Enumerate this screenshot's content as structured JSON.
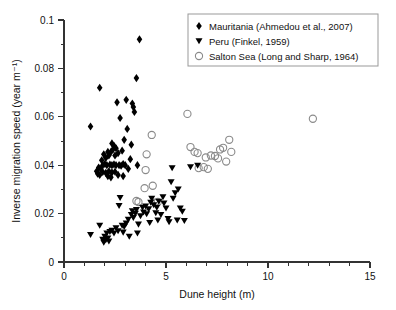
{
  "chart_data": {
    "type": "scatter",
    "title": "",
    "xlabel": "Dune height (m)",
    "ylabel": "Inverse migration speed (year m⁻¹)",
    "xlim": [
      0,
      15
    ],
    "ylim": [
      0,
      0.1
    ],
    "xticks": [
      0,
      5,
      10,
      15
    ],
    "xtick_labels": [
      "0",
      "5",
      "10",
      "15"
    ],
    "xminor_step": 1,
    "yticks": [
      0,
      0.02,
      0.04,
      0.06,
      0.08,
      0.1
    ],
    "ytick_labels": [
      "0",
      "0.02",
      "0.04",
      "0.06",
      "0.08",
      "0.1"
    ],
    "yminor_step": 0.01,
    "grid": false,
    "legend_position": "top-right",
    "series": [
      {
        "name": "Mauritania (Ahmedou et al., 2007)",
        "marker": "filled-diamond",
        "color": "#000000",
        "points": [
          [
            1.3,
            0.056
          ],
          [
            1.75,
            0.072
          ],
          [
            2.6,
            0.066
          ],
          [
            3.05,
            0.067
          ],
          [
            3.35,
            0.0655
          ],
          [
            3.4,
            0.064
          ],
          [
            3.45,
            0.062
          ],
          [
            3.55,
            0.076
          ],
          [
            3.7,
            0.092
          ],
          [
            2.75,
            0.0595
          ],
          [
            3.1,
            0.055
          ],
          [
            2.95,
            0.0505
          ],
          [
            2.55,
            0.047
          ],
          [
            2.35,
            0.049
          ],
          [
            2.4,
            0.0465
          ],
          [
            2.3,
            0.0455
          ],
          [
            2.2,
            0.044
          ],
          [
            2.15,
            0.0455
          ],
          [
            2.05,
            0.043
          ],
          [
            1.95,
            0.0445
          ],
          [
            2.5,
            0.044
          ],
          [
            2.65,
            0.045
          ],
          [
            2.85,
            0.046
          ],
          [
            1.85,
            0.042
          ],
          [
            1.9,
            0.04
          ],
          [
            2.0,
            0.0405
          ],
          [
            2.1,
            0.04
          ],
          [
            2.25,
            0.0402
          ],
          [
            2.35,
            0.04
          ],
          [
            2.45,
            0.0403
          ],
          [
            2.55,
            0.04
          ],
          [
            2.7,
            0.04
          ],
          [
            2.8,
            0.0398
          ],
          [
            2.9,
            0.0405
          ],
          [
            3.0,
            0.04
          ],
          [
            1.7,
            0.039
          ],
          [
            1.8,
            0.0385
          ],
          [
            1.6,
            0.0375
          ],
          [
            1.65,
            0.0365
          ],
          [
            1.75,
            0.036
          ],
          [
            1.9,
            0.0372
          ],
          [
            2.05,
            0.0368
          ],
          [
            2.2,
            0.0375
          ],
          [
            2.35,
            0.037
          ],
          [
            2.5,
            0.0373
          ],
          [
            2.65,
            0.036
          ],
          [
            2.15,
            0.0355
          ],
          [
            2.3,
            0.035
          ],
          [
            3.6,
            0.04
          ],
          [
            3.3,
            0.0485
          ],
          [
            3.25,
            0.0425
          ],
          [
            3.15,
            0.0385
          ],
          [
            2.9,
            0.0355
          ],
          [
            2.45,
            0.048
          ]
        ]
      },
      {
        "name": "Peru (Finkel, 1959)",
        "marker": "filled-triangle-down",
        "color": "#000000",
        "points": [
          [
            1.3,
            0.0112
          ],
          [
            1.75,
            0.015
          ],
          [
            1.9,
            0.0092
          ],
          [
            1.95,
            0.008
          ],
          [
            2.0,
            0.0105
          ],
          [
            2.05,
            0.009
          ],
          [
            2.1,
            0.0118
          ],
          [
            2.15,
            0.0098
          ],
          [
            2.25,
            0.0125
          ],
          [
            2.35,
            0.013
          ],
          [
            2.45,
            0.0118
          ],
          [
            2.55,
            0.014
          ],
          [
            2.65,
            0.0128
          ],
          [
            2.7,
            0.0232
          ],
          [
            2.75,
            0.0265
          ],
          [
            2.85,
            0.015
          ],
          [
            2.95,
            0.0145
          ],
          [
            3.05,
            0.016
          ],
          [
            3.15,
            0.0175
          ],
          [
            3.2,
            0.0105
          ],
          [
            3.3,
            0.0195
          ],
          [
            3.35,
            0.021
          ],
          [
            3.4,
            0.0182
          ],
          [
            3.5,
            0.02
          ],
          [
            3.55,
            0.0215
          ],
          [
            3.65,
            0.0155
          ],
          [
            3.75,
            0.019
          ],
          [
            3.85,
            0.0225
          ],
          [
            3.9,
            0.0205
          ],
          [
            4.0,
            0.023
          ],
          [
            4.05,
            0.0198
          ],
          [
            4.15,
            0.0218
          ],
          [
            4.25,
            0.0245
          ],
          [
            4.3,
            0.0262
          ],
          [
            4.4,
            0.0235
          ],
          [
            4.5,
            0.0202
          ],
          [
            4.55,
            0.0225
          ],
          [
            4.65,
            0.025
          ],
          [
            4.75,
            0.0195
          ],
          [
            4.85,
            0.0268
          ],
          [
            4.9,
            0.0242
          ],
          [
            5.0,
            0.0222
          ],
          [
            5.1,
            0.0178
          ],
          [
            5.15,
            0.0165
          ],
          [
            5.25,
            0.033
          ],
          [
            5.35,
            0.0262
          ],
          [
            5.45,
            0.0285
          ],
          [
            5.55,
            0.0172
          ],
          [
            5.6,
            0.03
          ],
          [
            5.7,
            0.0222
          ],
          [
            5.8,
            0.0208
          ],
          [
            5.9,
            0.017
          ],
          [
            5.3,
            0.0388
          ],
          [
            6.2,
            0.0392
          ],
          [
            6.55,
            0.0398
          ],
          [
            3.6,
            0.0118
          ],
          [
            2.9,
            0.0122
          ],
          [
            2.2,
            0.0085
          ],
          [
            4.6,
            0.0172
          ],
          [
            4.2,
            0.0162
          ]
        ]
      },
      {
        "name": "Salton Sea (Long and Sharp, 1964)",
        "marker": "open-circle",
        "color": "#8a8a8a",
        "points": [
          [
            3.55,
            0.0252
          ],
          [
            3.65,
            0.0248
          ],
          [
            3.95,
            0.0305
          ],
          [
            4.0,
            0.038
          ],
          [
            4.05,
            0.0445
          ],
          [
            4.35,
            0.0315
          ],
          [
            4.3,
            0.0525
          ],
          [
            4.45,
            0.0245
          ],
          [
            4.6,
            0.0248
          ],
          [
            6.05,
            0.0612
          ],
          [
            6.2,
            0.0475
          ],
          [
            6.4,
            0.0455
          ],
          [
            6.55,
            0.045
          ],
          [
            6.6,
            0.0388
          ],
          [
            6.85,
            0.0392
          ],
          [
            6.95,
            0.0432
          ],
          [
            7.05,
            0.0385
          ],
          [
            7.2,
            0.044
          ],
          [
            7.4,
            0.0438
          ],
          [
            7.55,
            0.0428
          ],
          [
            7.65,
            0.0465
          ],
          [
            7.8,
            0.0472
          ],
          [
            7.95,
            0.0415
          ],
          [
            8.1,
            0.0505
          ],
          [
            8.2,
            0.0455
          ],
          [
            12.2,
            0.0592
          ]
        ]
      }
    ]
  },
  "legend": {
    "entries": [
      {
        "label": "Mauritania (Ahmedou et al., 2007)",
        "marker": "filled-diamond"
      },
      {
        "label": "Peru (Finkel, 1959)",
        "marker": "filled-triangle-down"
      },
      {
        "label": "Salton Sea (Long and Sharp, 1964)",
        "marker": "open-circle"
      }
    ]
  }
}
